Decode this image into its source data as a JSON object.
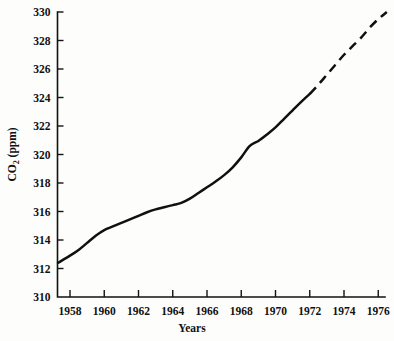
{
  "chart_data": {
    "type": "line",
    "title": "",
    "xlabel": "Years",
    "ylabel": "CO2 (ppm)",
    "ylabel_base": "CO",
    "ylabel_sub": "2",
    "ylabel_unit": " (ppm)",
    "xlim": [
      1957.3,
      1976.6
    ],
    "ylim": [
      310,
      330
    ],
    "grid": false,
    "legend": null,
    "xticks": [
      1958,
      1960,
      1962,
      1964,
      1966,
      1968,
      1970,
      1972,
      1974,
      1976
    ],
    "xtick_labels": [
      "1958",
      "1960",
      "1962",
      "1964",
      "1966",
      "1968",
      "1970",
      "1972",
      "1974",
      "1976"
    ],
    "yticks": [
      310,
      312,
      314,
      316,
      318,
      320,
      322,
      324,
      326,
      328,
      330
    ],
    "ytick_labels": [
      "310",
      "312",
      "314",
      "316",
      "318",
      "320",
      "322",
      "324",
      "326",
      "328",
      "330"
    ],
    "line_color": "#101010",
    "series": [
      {
        "name": "Measured CO2 (solid)",
        "style": "solid",
        "x": [
          1957.3,
          1958.0,
          1958.5,
          1959.0,
          1959.5,
          1960.0,
          1960.5,
          1961.0,
          1961.5,
          1962.0,
          1962.5,
          1963.0,
          1963.5,
          1964.0,
          1964.5,
          1965.0,
          1965.5,
          1966.0,
          1966.5,
          1967.0,
          1967.5,
          1968.0,
          1968.5,
          1969.0,
          1969.5,
          1970.0,
          1970.5,
          1971.0,
          1971.5,
          1972.0
        ],
        "y": [
          312.4,
          312.9,
          313.3,
          313.8,
          314.3,
          314.7,
          314.95,
          315.2,
          315.45,
          315.7,
          315.95,
          316.15,
          316.3,
          316.45,
          316.6,
          316.9,
          317.3,
          317.7,
          318.1,
          318.55,
          319.1,
          319.8,
          320.6,
          320.95,
          321.4,
          321.9,
          322.5,
          323.1,
          323.7,
          324.25
        ]
      },
      {
        "name": "Projected CO2 (dashed)",
        "style": "dashed",
        "x": [
          1972.0,
          1972.5,
          1973.0,
          1973.5,
          1974.0,
          1974.5,
          1975.0,
          1975.5,
          1976.0,
          1976.5
        ],
        "y": [
          324.25,
          324.9,
          325.6,
          326.3,
          327.0,
          327.6,
          328.2,
          328.9,
          329.5,
          330.0
        ]
      }
    ]
  }
}
